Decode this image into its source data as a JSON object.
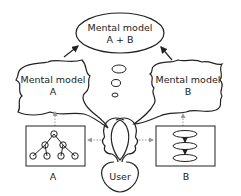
{
  "diagram": {
    "combined_model": {
      "line1": "Mental model",
      "line2": "A + B"
    },
    "model_a": {
      "line1": "Mental model",
      "line2": "A"
    },
    "model_b": {
      "line1": "Mental model",
      "line2": "B"
    },
    "system_a_label": "A",
    "system_b_label": "B",
    "user_label": "User",
    "system_a_icon": "tree-hierarchy-icon",
    "system_b_icon": "stacked-ellipses-icon"
  }
}
